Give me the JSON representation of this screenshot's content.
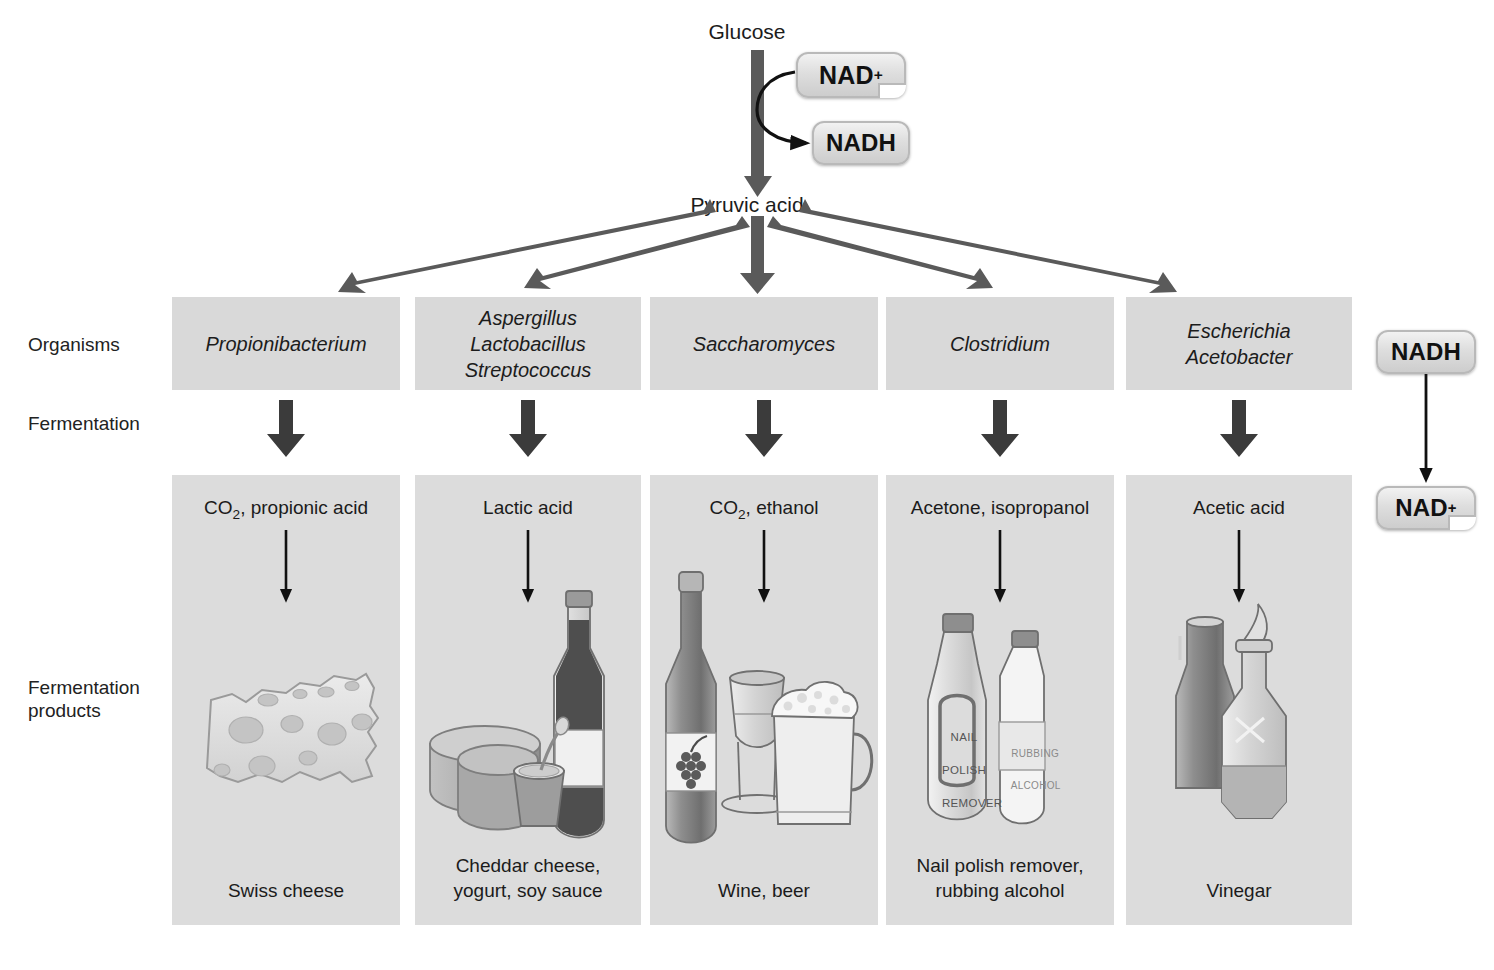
{
  "figure": {
    "top_molecule": "Glucose",
    "mid_molecule": "Pyruvic acid",
    "cofactor_in": "NAD",
    "cofactor_in_sup": "+",
    "cofactor_out": "NADH",
    "recycle_from": "NADH",
    "recycle_to": "NAD",
    "recycle_to_sup": "+"
  },
  "row_labels": {
    "organisms": "Organisms",
    "fermentation": "Fermentation",
    "products_line1": "Fermentation",
    "products_line2": "products"
  },
  "columns": [
    {
      "organisms": [
        "Propionibacterium"
      ],
      "chemicals_pre": "CO",
      "chemicals_sub": "2",
      "chemicals_post": ", propionic acid",
      "product_lines": [
        "Swiss cheese"
      ],
      "illustration": "swiss-cheese-wedge"
    },
    {
      "organisms": [
        "Aspergillus",
        "Lactobacillus",
        "Streptococcus"
      ],
      "chemicals_pre": "Lactic acid",
      "chemicals_sub": "",
      "chemicals_post": "",
      "product_lines": [
        "Cheddar cheese,",
        "yogurt, soy sauce"
      ],
      "illustration": "cheese-yogurt-soysauce"
    },
    {
      "organisms": [
        "Saccharomyces"
      ],
      "chemicals_pre": "CO",
      "chemicals_sub": "2",
      "chemicals_post": ", ethanol",
      "product_lines": [
        "Wine, beer"
      ],
      "illustration": "wine-bottle-glass-beer-mug"
    },
    {
      "organisms": [
        "Clostridium"
      ],
      "chemicals_pre": "Acetone, isopropanol",
      "chemicals_sub": "",
      "chemicals_post": "",
      "product_lines": [
        "Nail polish remover,",
        "rubbing alcohol"
      ],
      "illustration": "nail-polish-remover-rubbing-alcohol"
    },
    {
      "organisms": [
        "Escherichia",
        "Acetobacter"
      ],
      "chemicals_pre": "Acetic acid",
      "chemicals_sub": "",
      "chemicals_post": "",
      "product_lines": [
        "Vinegar"
      ],
      "illustration": "vinegar-bottles"
    }
  ],
  "illustration_text": {
    "nail_polish_line1": "NAIL",
    "nail_polish_line2": "POLISH",
    "nail_polish_line3": "REMOVER",
    "rubbing_line1": "RUBBING",
    "rubbing_line2": "ALCOHOL"
  },
  "colors": {
    "panel_gray": "#dcdcdc",
    "box_gray": "#d9d9d9",
    "arrow_thick": "#5a5a5a",
    "arrow_fermentation": "#3b3b3b",
    "arrow_thin": "#111111",
    "text": "#1b1b1b"
  }
}
